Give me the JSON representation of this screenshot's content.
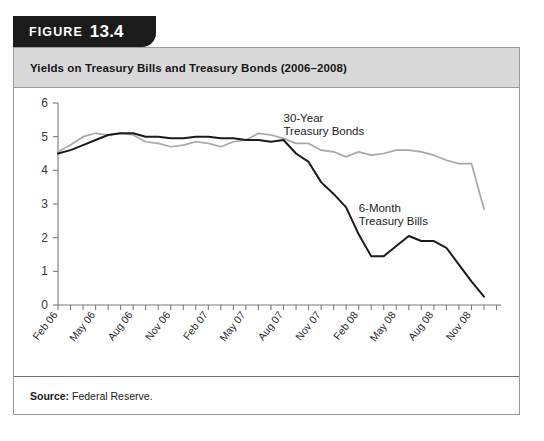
{
  "figure": {
    "tab_word": "FIGURE",
    "tab_number": "13.4",
    "title": "Yields on Treasury Bills and Treasury Bonds (2006–2008)",
    "source_label": "Source:",
    "source_value": "Federal Reserve."
  },
  "colors": {
    "tab_background": "#1b1b1b",
    "header_background": "#d9d9d9",
    "panel_border": "#9a9a9a",
    "bonds_line": "#a8a8a8",
    "bills_line": "#1b1b1b",
    "axis": "#7a7a7a"
  },
  "chart_data": {
    "type": "line",
    "title": "Yields on Treasury Bills and Treasury Bonds (2006–2008)",
    "xlabel": "",
    "ylabel": "",
    "ylim": [
      0,
      6
    ],
    "yticks": [
      0,
      1,
      2,
      3,
      4,
      5,
      6
    ],
    "ytick_labels": [
      "0",
      "1",
      "2",
      "3",
      "4",
      "5",
      "6"
    ],
    "grid": false,
    "legend_position": "inline-annotation",
    "x": [
      "Feb 06",
      "Mar 06",
      "Apr 06",
      "May 06",
      "Jun 06",
      "Jul 06",
      "Aug 06",
      "Sep 06",
      "Oct 06",
      "Nov 06",
      "Dec 06",
      "Jan 07",
      "Feb 07",
      "Mar 07",
      "Apr 07",
      "May 07",
      "Jun 07",
      "Jul 07",
      "Aug 07",
      "Sep 07",
      "Oct 07",
      "Nov 07",
      "Dec 07",
      "Jan 08",
      "Feb 08",
      "Mar 08",
      "Apr 08",
      "May 08",
      "Jun 08",
      "Jul 08",
      "Aug 08",
      "Sep 08",
      "Oct 08",
      "Nov 08",
      "Dec 08"
    ],
    "xtick_labels": [
      "Feb 06",
      "May 06",
      "Aug 06",
      "Nov 06",
      "Feb 07",
      "May 07",
      "Aug 07",
      "Nov 07",
      "Feb 08",
      "May 08",
      "Aug 08",
      "Nov 08"
    ],
    "xtick_indices": [
      0,
      3,
      6,
      9,
      12,
      15,
      18,
      21,
      24,
      27,
      30,
      33
    ],
    "series": [
      {
        "name": "30-Year Treasury Bonds",
        "label_line1": "30-Year",
        "label_line2": "Treasury Bonds",
        "color": "#a8a8a8",
        "values": [
          4.55,
          4.75,
          5.0,
          5.1,
          5.05,
          5.1,
          5.05,
          4.85,
          4.8,
          4.7,
          4.75,
          4.85,
          4.8,
          4.7,
          4.85,
          4.9,
          5.1,
          5.05,
          4.95,
          4.8,
          4.8,
          4.6,
          4.55,
          4.4,
          4.55,
          4.45,
          4.5,
          4.6,
          4.6,
          4.55,
          4.45,
          4.3,
          4.2,
          4.2,
          2.85
        ]
      },
      {
        "name": "6-Month Treasury Bills",
        "label_line1": "6-Month",
        "label_line2": "Treasury Bills",
        "color": "#1b1b1b",
        "values": [
          4.5,
          4.6,
          4.75,
          4.9,
          5.05,
          5.1,
          5.1,
          5.0,
          5.0,
          4.95,
          4.95,
          5.0,
          5.0,
          4.95,
          4.95,
          4.9,
          4.9,
          4.85,
          4.9,
          4.5,
          4.25,
          3.65,
          3.3,
          2.9,
          2.1,
          1.45,
          1.45,
          1.75,
          2.05,
          1.9,
          1.9,
          1.7,
          1.2,
          0.7,
          0.25
        ]
      }
    ],
    "annotations": [
      {
        "text": "30-Year Treasury Bonds",
        "x_index": 18,
        "y_value": 5.45
      },
      {
        "text": "6-Month Treasury Bills",
        "x_index": 24,
        "y_value": 2.75
      }
    ]
  }
}
